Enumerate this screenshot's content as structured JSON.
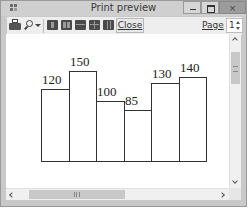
{
  "window": {
    "title": "Print preview",
    "controls": {
      "minimize": "minimize",
      "maximize": "maximize",
      "close": "×"
    }
  },
  "toolbar": {
    "icons": [
      "printer-icon",
      "zoom-icon",
      "zoom-dropdown-icon",
      "one-page-icon",
      "two-pages-icon",
      "three-pages-icon",
      "four-pages-icon",
      "six-pages-icon"
    ],
    "close_label": "Close",
    "page_label": "Page",
    "page_value": "1"
  },
  "chart_data": {
    "type": "bar",
    "categories": [
      "1",
      "2",
      "3",
      "4",
      "5",
      "6"
    ],
    "values": [
      120,
      150,
      100,
      85,
      130,
      140
    ],
    "labels": [
      "120",
      "150",
      "100",
      "85",
      "130",
      "140"
    ],
    "title": "",
    "xlabel": "",
    "ylabel": "",
    "grid": false,
    "legend": false
  },
  "scrollbars": {
    "vertical": true,
    "horizontal": true
  }
}
